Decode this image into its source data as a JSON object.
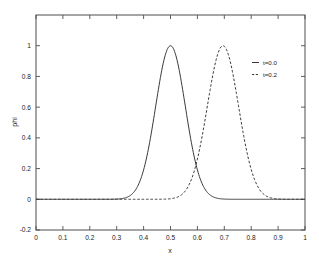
{
  "chart_data": {
    "type": "line",
    "title": "",
    "xlabel": "x",
    "ylabel": "phi",
    "xlim": [
      0,
      1
    ],
    "ylim": [
      -0.2,
      1.2
    ],
    "grid": false,
    "legend_position": "right-upper-inside",
    "xticks": [
      "0",
      "0.1",
      "0.2",
      "0.3",
      "0.4",
      "0.5",
      "0.6",
      "0.7",
      "0.8",
      "0.9",
      "1"
    ],
    "xtick_values": [
      0,
      0.1,
      0.2,
      0.3,
      0.4,
      0.5,
      0.6,
      0.7,
      0.8,
      0.9,
      1
    ],
    "yticks": [
      "-0.2",
      "0",
      "0.2",
      "0.4",
      "0.6",
      "0.8",
      "1"
    ],
    "ytick_values": [
      -0.2,
      0,
      0.2,
      0.4,
      0.6,
      0.8,
      1
    ],
    "series": [
      {
        "name": "t=0.0",
        "style": "solid",
        "color": "#3a3a3a",
        "peak_x": 0.5,
        "peak_y": 1.0,
        "sigma": 0.055,
        "x": [
          0.0,
          0.05,
          0.1,
          0.15,
          0.2,
          0.25,
          0.28,
          0.3,
          0.32,
          0.34,
          0.36,
          0.38,
          0.4,
          0.42,
          0.44,
          0.46,
          0.48,
          0.5,
          0.52,
          0.54,
          0.56,
          0.58,
          0.6,
          0.62,
          0.64,
          0.66,
          0.68,
          0.7,
          0.72,
          0.75,
          0.8,
          0.85,
          0.9,
          0.95,
          1.0
        ],
        "values": [
          0.0,
          0.0,
          0.0,
          0.0,
          0.0,
          0.001,
          0.003,
          0.01,
          0.024,
          0.052,
          0.103,
          0.185,
          0.303,
          0.449,
          0.603,
          0.765,
          0.893,
          1.0,
          0.893,
          0.765,
          0.603,
          0.449,
          0.303,
          0.185,
          0.103,
          0.052,
          0.024,
          0.01,
          0.004,
          0.001,
          0.0,
          0.0,
          0.0,
          0.0,
          0.0
        ]
      },
      {
        "name": "t=0.2",
        "style": "dashed",
        "color": "#3a3a3a",
        "peak_x": 0.695,
        "peak_y": 1.0,
        "sigma": 0.058,
        "x": [
          0.0,
          0.1,
          0.2,
          0.3,
          0.4,
          0.45,
          0.48,
          0.5,
          0.52,
          0.54,
          0.56,
          0.58,
          0.6,
          0.62,
          0.64,
          0.66,
          0.675,
          0.695,
          0.715,
          0.735,
          0.75,
          0.77,
          0.79,
          0.81,
          0.83,
          0.85,
          0.87,
          0.9,
          0.93,
          0.96,
          1.0
        ],
        "values": [
          0.0,
          0.0,
          0.0,
          0.001,
          0.003,
          0.01,
          0.022,
          0.035,
          0.057,
          0.092,
          0.145,
          0.22,
          0.32,
          0.443,
          0.58,
          0.74,
          0.866,
          1.0,
          0.866,
          0.74,
          0.62,
          0.46,
          0.32,
          0.21,
          0.13,
          0.075,
          0.042,
          0.015,
          0.005,
          0.002,
          0.0
        ]
      }
    ]
  },
  "legend": {
    "entries": [
      {
        "label": "t=0.0",
        "style": "solid"
      },
      {
        "label": "t=0.2",
        "style": "dashed"
      }
    ]
  }
}
